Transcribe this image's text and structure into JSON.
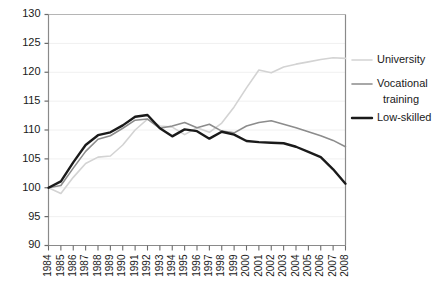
{
  "chart_data": {
    "type": "line",
    "title": "",
    "xlabel": "",
    "ylabel": "",
    "ylim": [
      90,
      130
    ],
    "ytick_values": [
      90,
      95,
      100,
      105,
      110,
      115,
      120,
      125,
      130
    ],
    "ytick_labels": [
      "90",
      "95",
      "100",
      "105",
      "110",
      "115",
      "120",
      "125",
      "130"
    ],
    "grid": true,
    "legend_position": "right",
    "x": [
      1984,
      1985,
      1986,
      1987,
      1988,
      1989,
      1990,
      1991,
      1992,
      1993,
      1994,
      1995,
      1996,
      1997,
      1998,
      1999,
      2000,
      2001,
      2002,
      2003,
      2004,
      2005,
      2006,
      2007,
      2008
    ],
    "xtick_labels": [
      "1984",
      "1985",
      "1986",
      "1987",
      "1988",
      "1989",
      "1990",
      "1991",
      "1992",
      "1993",
      "1994",
      "1995",
      "1996",
      "1997",
      "1998",
      "1999",
      "2000",
      "2001",
      "2002",
      "2003",
      "2004",
      "2005",
      "2006",
      "2007",
      "2008"
    ],
    "series": [
      {
        "name": "University",
        "color": "#d3d3d3",
        "width": 1.6,
        "values": [
          100.0,
          99.0,
          101.8,
          104.2,
          105.3,
          105.5,
          107.4,
          110.0,
          111.9,
          110.7,
          110.5,
          109.2,
          110.4,
          109.6,
          111.2,
          114.0,
          117.3,
          120.4,
          119.9,
          120.9,
          121.4,
          121.8,
          122.2,
          122.5,
          122.4
        ]
      },
      {
        "name": "Vocational training",
        "color": "#8c8c8c",
        "width": 1.6,
        "values": [
          100.0,
          100.4,
          103.4,
          106.3,
          108.4,
          109.0,
          110.3,
          111.7,
          111.9,
          110.3,
          110.7,
          111.3,
          110.4,
          111.0,
          109.8,
          109.5,
          110.7,
          111.3,
          111.6,
          111.0,
          110.4,
          109.7,
          109.0,
          108.2,
          107.1
        ]
      },
      {
        "name": "Low-skilled",
        "color": "#1a1a1a",
        "width": 2.4,
        "values": [
          100.0,
          101.1,
          104.4,
          107.4,
          109.1,
          109.6,
          110.8,
          112.3,
          112.6,
          110.3,
          108.9,
          110.1,
          109.8,
          108.5,
          109.7,
          109.2,
          108.1,
          107.9,
          107.8,
          107.7,
          107.1,
          106.2,
          105.3,
          103.2,
          100.7
        ]
      }
    ]
  },
  "legend": {
    "items": [
      {
        "label": "University",
        "label2": ""
      },
      {
        "label": "Vocational",
        "label2": "training"
      },
      {
        "label": "Low-skilled",
        "label2": ""
      }
    ]
  }
}
